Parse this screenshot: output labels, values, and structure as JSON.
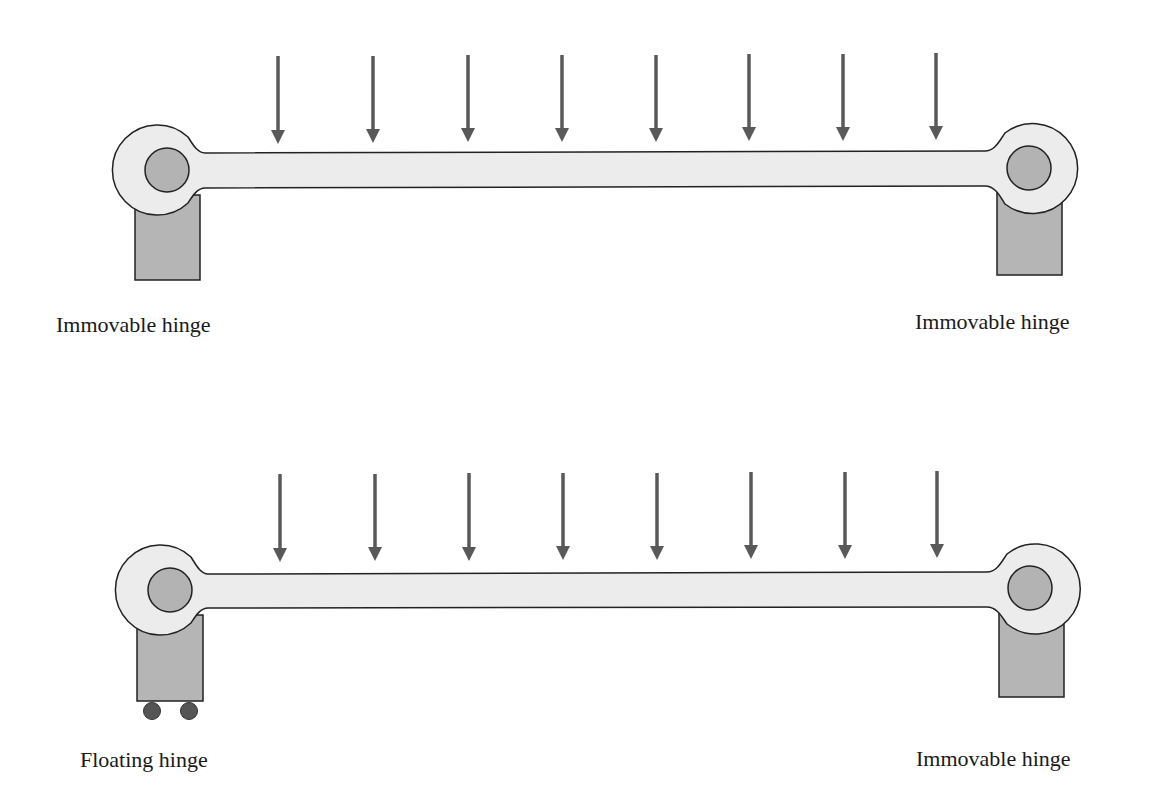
{
  "colors": {
    "beam_fill": "#ececec",
    "outline": "#222222",
    "pin_fill": "#b3b3b3",
    "support_fill": "#b5b5b5",
    "arrow": "#595959",
    "wheel": "#555555"
  },
  "diagrams": [
    {
      "name": "fixed-fixed-beam",
      "load_arrow_count": 8,
      "left_support": {
        "type": "immovable",
        "label": "Immovable hinge"
      },
      "right_support": {
        "type": "immovable",
        "label": "Immovable hinge"
      }
    },
    {
      "name": "floating-fixed-beam",
      "load_arrow_count": 8,
      "left_support": {
        "type": "floating",
        "label": "Floating hinge"
      },
      "right_support": {
        "type": "immovable",
        "label": "Immovable hinge"
      }
    }
  ]
}
